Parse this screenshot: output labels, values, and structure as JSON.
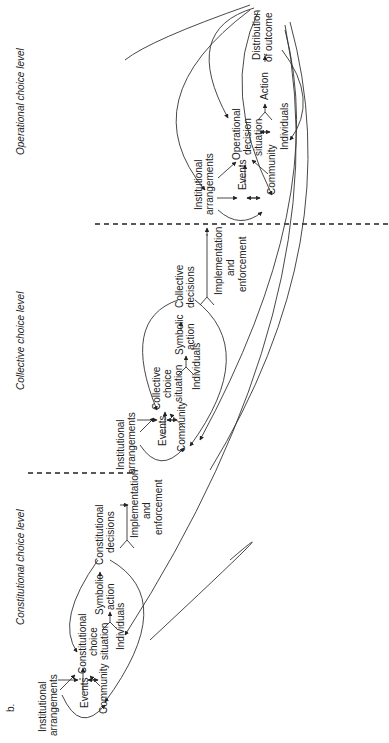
{
  "figure_label": "b.",
  "levels": [
    {
      "name": "Constitutional choice level"
    },
    {
      "name": "Collective choice level"
    },
    {
      "name": "Operational choice level"
    }
  ],
  "constitutional": {
    "inst1": "Institutional",
    "inst2": "arrangements",
    "events": "Events",
    "community": "Community",
    "sit1": "Constitutional",
    "sit2": "choice",
    "sit3": "situation",
    "individuals": "Individuals",
    "sym1": "Symbolic",
    "sym2": "action",
    "dec1": "Constitutional",
    "dec2": "decisions",
    "impl1": "Implementation",
    "impl2": "and",
    "impl3": "enforcement"
  },
  "collective": {
    "inst1": "Institutional",
    "inst2": "arrangements",
    "events": "Events",
    "community": "Community",
    "sit1": "Collective",
    "sit2": "choice",
    "sit3": "situation",
    "individuals": "Individuals",
    "sym1": "Symbolic",
    "sym2": "action",
    "dec1": "Collective",
    "dec2": "decisions",
    "impl1": "Implementation",
    "impl2": "and",
    "impl3": "enforcement"
  },
  "operational": {
    "inst1": "Institutional",
    "inst2": "arrangements",
    "events": "Events",
    "community": "Community",
    "sit1": "Operational",
    "sit2": "decision",
    "sit3": "situation",
    "individuals": "Individuals",
    "action": "Action",
    "out1": "Distribution",
    "out2": "of outcome"
  }
}
